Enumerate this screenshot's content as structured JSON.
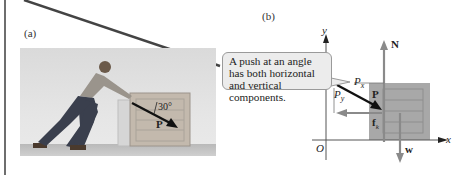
{
  "figure": {
    "panel_a": {
      "label": "(a)",
      "angle_label": "30°",
      "force_label": "P"
    },
    "panel_b": {
      "label": "(b)",
      "callout_text": "A push at an angle has both horizontal and vertical components.",
      "axis_labels": {
        "y": "y",
        "x": "x",
        "origin": "O"
      },
      "vector_labels": {
        "normal": "N",
        "push": "P",
        "px": "P",
        "px_sub": "x",
        "py": "P",
        "py_sub": "y",
        "friction": "f",
        "friction_sub": "k",
        "weight": "w"
      }
    }
  },
  "colors": {
    "crate_fill": "#a8a8a8",
    "arrow_gray": "#8a8a8a",
    "arrow_dark": "#111111",
    "callout_bg": "#ececec"
  }
}
